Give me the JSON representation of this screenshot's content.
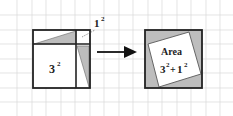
{
  "diagram": {
    "left_square": {
      "big_label": "3",
      "big_exp": "2",
      "small_label": "1",
      "small_exp": "2"
    },
    "right_square": {
      "title": "Area",
      "formula_a": "3",
      "formula_a_exp": "2",
      "plus": "+",
      "formula_b": "1",
      "formula_b_exp": "2"
    },
    "colors": {
      "grid": "#d9d9d9",
      "outline": "#222222",
      "shade": "#bdbdbd",
      "arrow": "#111111"
    }
  }
}
